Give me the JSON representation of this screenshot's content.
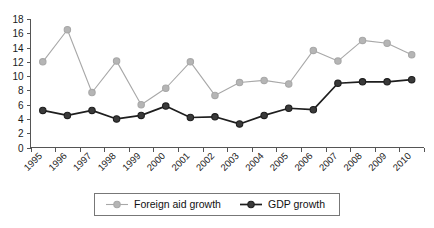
{
  "chart_data": {
    "type": "line",
    "title": "",
    "subtitle": "",
    "xlabel": "",
    "ylabel": "",
    "categories": [
      "1995",
      "1996",
      "1997",
      "1998",
      "1999",
      "2000",
      "2001",
      "2002",
      "2003",
      "2004",
      "2005",
      "2006",
      "2007",
      "2008",
      "2009",
      "2010"
    ],
    "ylim": [
      0,
      18
    ],
    "yticks": [
      0,
      2,
      4,
      6,
      8,
      10,
      12,
      14,
      16,
      18
    ],
    "ytick_labels": [
      "0",
      "2",
      "4",
      "6",
      "8",
      "10",
      "12",
      "14",
      "16",
      "18"
    ],
    "grid": false,
    "legend_position": "bottom",
    "series": [
      {
        "name": "Foreign aid growth",
        "color": "#a8a8a8",
        "marker": "open-circle",
        "marker_fill": "#b5b5b5",
        "values": [
          12.0,
          16.5,
          7.7,
          12.1,
          6.0,
          8.3,
          12.0,
          7.3,
          9.1,
          9.4,
          8.9,
          13.6,
          12.1,
          15.0,
          14.6,
          13.0
        ]
      },
      {
        "name": "GDP growth",
        "color": "#1e1e1e",
        "marker": "filled-circle",
        "marker_fill": "#3a3a3a",
        "values": [
          5.2,
          4.5,
          5.2,
          4.0,
          4.5,
          5.8,
          4.2,
          4.3,
          3.3,
          4.5,
          5.5,
          5.3,
          9.0,
          9.2,
          9.2,
          9.5
        ]
      }
    ]
  },
  "legend": {
    "items": [
      {
        "label": "Foreign aid growth"
      },
      {
        "label": "GDP growth"
      }
    ]
  },
  "axes": {
    "y_axis_name": "value-axis",
    "x_axis_name": "year-axis"
  }
}
